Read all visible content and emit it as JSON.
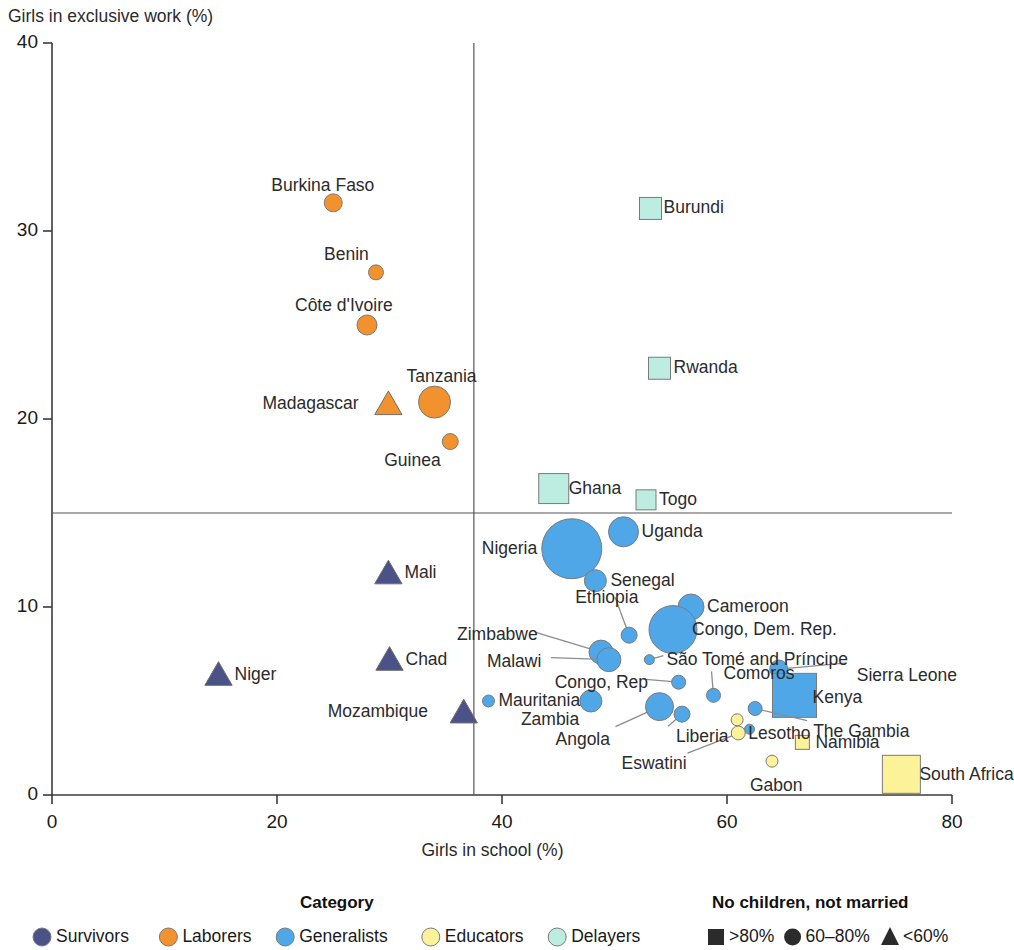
{
  "chart_data": {
    "type": "scatter",
    "title": "",
    "xlabel": "Girls in school (%)",
    "ylabel": "Girls in exclusive work (%)",
    "xlim": [
      0,
      80
    ],
    "ylim": [
      0,
      40
    ],
    "xticks": [
      "0",
      "20",
      "40",
      "60",
      "80"
    ],
    "yticks": [
      "0",
      "10",
      "20",
      "30",
      "40"
    ],
    "grid": false,
    "reference_lines": {
      "vertical_x": 37.5,
      "horizontal_y": 15
    },
    "size_encoding": "bubble area = population of girls",
    "shape_encoding": "square = >80%, circle = 60-80%, triangle = <60% (no children, not married)",
    "points": [
      {
        "name": "Burkina Faso",
        "x": 25.0,
        "y": 31.5,
        "category": "Laborers",
        "shape": "circle",
        "size": 9,
        "label_dx": -62,
        "label_dy": -26
      },
      {
        "name": "Benin",
        "x": 28.8,
        "y": 27.8,
        "category": "Laborers",
        "shape": "circle",
        "size": 7.5,
        "label_dx": -52,
        "label_dy": -26
      },
      {
        "name": "Côte d'Ivoire",
        "x": 28.0,
        "y": 25.0,
        "category": "Laborers",
        "shape": "circle",
        "size": 10,
        "label_dx": -72,
        "label_dy": -28
      },
      {
        "name": "Tanzania",
        "x": 34.0,
        "y": 20.9,
        "category": "Laborers",
        "shape": "circle",
        "size": 16,
        "label_dx": -28,
        "label_dy": -34
      },
      {
        "name": "Madagascar",
        "x": 29.9,
        "y": 20.8,
        "category": "Laborers",
        "shape": "triangle",
        "size": 13,
        "label_dx": -126,
        "label_dy": -9
      },
      {
        "name": "Guinea",
        "x": 35.4,
        "y": 18.8,
        "category": "Laborers",
        "shape": "circle",
        "size": 8,
        "label_dx": -66,
        "label_dy": 10
      },
      {
        "name": "Burundi",
        "x": 53.2,
        "y": 31.2,
        "category": "Delayers",
        "shape": "square",
        "size": 11,
        "label_dx": 13,
        "label_dy": -9
      },
      {
        "name": "Rwanda",
        "x": 54.0,
        "y": 22.7,
        "category": "Delayers",
        "shape": "square",
        "size": 11,
        "label_dx": 14,
        "label_dy": -9
      },
      {
        "name": "Ghana",
        "x": 44.6,
        "y": 16.3,
        "category": "Delayers",
        "shape": "square",
        "size": 15,
        "label_dx": 15,
        "label_dy": -9
      },
      {
        "name": "Togo",
        "x": 52.8,
        "y": 15.7,
        "category": "Delayers",
        "shape": "square",
        "size": 10,
        "label_dx": 13,
        "label_dy": -9
      },
      {
        "name": "Nigeria",
        "x": 46.2,
        "y": 13.1,
        "category": "Generalists",
        "shape": "circle",
        "size": 30,
        "label_dx": -90,
        "label_dy": -9
      },
      {
        "name": "Uganda",
        "x": 50.8,
        "y": 14.0,
        "category": "Generalists",
        "shape": "circle",
        "size": 15,
        "label_dx": 18,
        "label_dy": -9
      },
      {
        "name": "Senegal",
        "x": 48.3,
        "y": 11.4,
        "category": "Generalists",
        "shape": "circle",
        "size": 11,
        "label_dx": 15,
        "label_dy": -9
      },
      {
        "name": "Cameroon",
        "x": 56.8,
        "y": 10.0,
        "category": "Generalists",
        "shape": "circle",
        "size": 13,
        "label_dx": 16,
        "label_dy": -9
      },
      {
        "name": "Congo, Dem. Rep.",
        "x": 55.2,
        "y": 8.8,
        "category": "Generalists",
        "shape": "circle",
        "size": 24,
        "label_dx": 19,
        "label_dy": -9
      },
      {
        "name": "Ethiopia",
        "x": 51.3,
        "y": 8.5,
        "category": "Generalists",
        "shape": "circle",
        "size": 8,
        "label_dx": -54,
        "label_dy": -46,
        "leader": true
      },
      {
        "name": "Zimbabwe",
        "x": 48.8,
        "y": 7.6,
        "category": "Generalists",
        "shape": "circle",
        "size": 12,
        "label_dx": -144,
        "label_dy": -26,
        "leader": true
      },
      {
        "name": "Malawi",
        "x": 49.5,
        "y": 7.2,
        "category": "Generalists",
        "shape": "circle",
        "size": 12,
        "label_dx": -122,
        "label_dy": -7,
        "leader": true
      },
      {
        "name": "São Tomé and Príncipe",
        "x": 53.1,
        "y": 7.2,
        "category": "Generalists",
        "shape": "circle",
        "size": 5,
        "label_dx": 17,
        "label_dy": -9,
        "leader": true
      },
      {
        "name": "Congo, Rep",
        "x": 55.7,
        "y": 6.0,
        "category": "Generalists",
        "shape": "circle",
        "size": 7,
        "label_dx": -124,
        "label_dy": -8,
        "leader": true
      },
      {
        "name": "Comoros",
        "x": 58.8,
        "y": 5.3,
        "category": "Generalists",
        "shape": "circle",
        "size": 7,
        "label_dx": 10,
        "label_dy": -30,
        "leader": true
      },
      {
        "name": "Mauritania",
        "x": 38.8,
        "y": 5.0,
        "category": "Generalists",
        "shape": "circle",
        "size": 6,
        "label_dx": 10,
        "label_dy": -9
      },
      {
        "name": "Zambia",
        "x": 47.9,
        "y": 5.0,
        "category": "Generalists",
        "shape": "circle",
        "size": 11,
        "label_dx": -70,
        "label_dy": 10
      },
      {
        "name": "Angola",
        "x": 54.0,
        "y": 4.7,
        "category": "Generalists",
        "shape": "circle",
        "size": 14,
        "label_dx": -104,
        "label_dy": 24,
        "leader": true
      },
      {
        "name": "Liberia",
        "x": 56.0,
        "y": 4.3,
        "category": "Generalists",
        "shape": "circle",
        "size": 8,
        "label_dx": -6,
        "label_dy": 14,
        "leader": true
      },
      {
        "name": "Sierra Leone",
        "x": 64.6,
        "y": 6.7,
        "category": "Generalists",
        "shape": "circle",
        "size": 9,
        "label_dx": 78,
        "label_dy": -2,
        "leader": true
      },
      {
        "name": "Kenya",
        "x": 66.0,
        "y": 5.3,
        "category": "Generalists",
        "shape": "square",
        "size": 22,
        "label_dx": 18,
        "label_dy": -6
      },
      {
        "name": "The Gambia",
        "x": 62.5,
        "y": 4.6,
        "category": "Generalists",
        "shape": "circle",
        "size": 7,
        "label_dx": 58,
        "label_dy": 14,
        "leader": true
      },
      {
        "name": "Eswatini",
        "x": 62.0,
        "y": 3.5,
        "category": "Generalists",
        "shape": "circle",
        "size": 5,
        "label_dx": -128,
        "label_dy": 26,
        "leader": true
      },
      {
        "name": "Lesotho",
        "x": 61.0,
        "y": 3.3,
        "category": "Educators",
        "shape": "circle",
        "size": 7,
        "label_dx": 10,
        "label_dy": -8
      },
      {
        "name": "Lesotho2",
        "x": 60.9,
        "y": 4.0,
        "category": "Educators",
        "shape": "circle",
        "size": 6,
        "label_dx": 0,
        "label_dy": 0,
        "hide_label": true
      },
      {
        "name": "Namibia",
        "x": 66.7,
        "y": 2.8,
        "category": "Educators",
        "shape": "square",
        "size": 7,
        "label_dx": 13,
        "label_dy": -8
      },
      {
        "name": "Gabon",
        "x": 64.0,
        "y": 1.8,
        "category": "Educators",
        "shape": "circle",
        "size": 6,
        "label_dx": -22,
        "label_dy": 16
      },
      {
        "name": "South Africa",
        "x": 75.5,
        "y": 1.1,
        "category": "Educators",
        "shape": "square",
        "size": 19,
        "label_dx": 18,
        "label_dy": -8
      },
      {
        "name": "Mali",
        "x": 29.9,
        "y": 11.8,
        "category": "Survivors",
        "shape": "triangle",
        "size": 13,
        "label_dx": 16,
        "label_dy": -9
      },
      {
        "name": "Chad",
        "x": 30.0,
        "y": 7.2,
        "category": "Survivors",
        "shape": "triangle",
        "size": 13,
        "label_dx": 16,
        "label_dy": -9
      },
      {
        "name": "Niger",
        "x": 14.8,
        "y": 6.4,
        "category": "Survivors",
        "shape": "triangle",
        "size": 13,
        "label_dx": 16,
        "label_dy": -9
      },
      {
        "name": "Mozambique",
        "x": 36.6,
        "y": 4.4,
        "category": "Survivors",
        "shape": "triangle",
        "size": 13,
        "label_dx": -136,
        "label_dy": -9
      }
    ]
  },
  "legend": {
    "category_title": "Category",
    "marriage_title": "No children, not married",
    "categories": [
      {
        "label": "Survivors",
        "color": "#4b5287",
        "marker": "circle"
      },
      {
        "label": "Laborers",
        "color": "#f2922f",
        "marker": "circle"
      },
      {
        "label": "Generalists",
        "color": "#4fa7e8",
        "marker": "circle"
      },
      {
        "label": "Educators",
        "color": "#fbf29a",
        "marker": "circle"
      },
      {
        "label": "Delayers",
        "color": "#bdece0",
        "marker": "circle"
      }
    ],
    "marriage": [
      {
        "label": ">80%",
        "marker": "square"
      },
      {
        "label": "60–80%",
        "marker": "circle"
      },
      {
        "label": "<60%",
        "marker": "triangle"
      }
    ]
  },
  "colors": {
    "survivors": "#4b5287",
    "laborers": "#f2922f",
    "generalists": "#4fa7e8",
    "educators": "#fbf29a",
    "delayers": "#bdece0",
    "axis": "#3a3a3a",
    "leader": "#8c8c8c"
  }
}
